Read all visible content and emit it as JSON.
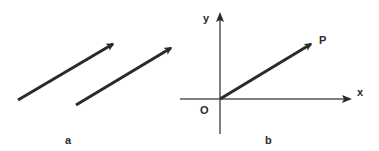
{
  "figure": {
    "panel_a": {
      "caption": "a",
      "arrows": [
        {
          "name": "vector-arrow-1",
          "from": [
            18,
            100
          ],
          "to": [
            115,
            43
          ]
        },
        {
          "name": "vector-arrow-2",
          "from": [
            76,
            105
          ],
          "to": [
            173,
            47
          ]
        }
      ]
    },
    "panel_b": {
      "caption": "b",
      "origin_label": "O",
      "x_axis_label": "x",
      "y_axis_label": "y",
      "point_label": "P",
      "origin": [
        220,
        99
      ],
      "x_axis": {
        "from": [
          180,
          99
        ],
        "to": [
          352,
          99
        ]
      },
      "y_axis": {
        "from": [
          220,
          134
        ],
        "to": [
          220,
          12
        ]
      },
      "vector_op": {
        "from": [
          220,
          99
        ],
        "to": [
          313,
          43
        ]
      }
    },
    "colors": {
      "vector": "#2a2a2a",
      "axis": "#555555",
      "text": "#2a2a2a",
      "background": "#ffffff"
    }
  }
}
